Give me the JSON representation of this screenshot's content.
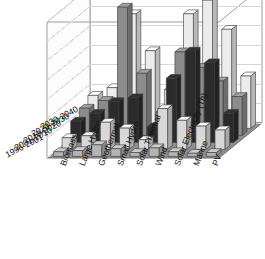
{
  "chart_data": {
    "type": "bar",
    "projection": "3d-bar",
    "title": "",
    "subtitle": "",
    "xlabel": "",
    "ylabel": "",
    "zlabel": "",
    "ylim": [
      0,
      0.35
    ],
    "grid": true,
    "legend_position": "none",
    "decimal_separator": ",",
    "categories": [
      "Biomass",
      "Large Hydro",
      "Geothermal",
      "Small Hydro",
      "Solar Thermal",
      "Wind",
      "Solar Electricity (Th)",
      "Marine",
      "PV"
    ],
    "ytick_labels": [
      "0",
      "0,05",
      "0,1",
      "0,15",
      "0,2",
      "0,25",
      "0,3",
      "0,35"
    ],
    "ytick_values": [
      0,
      0.05,
      0.1,
      0.15,
      0.2,
      0.25,
      0.3,
      0.35
    ],
    "series": [
      {
        "name": "1996-2001",
        "color": "#b4b4b4",
        "values": [
          0.012,
          0.015,
          0.03,
          0.02,
          0.01,
          0.022,
          0.012,
          0.008,
          0.01
        ]
      },
      {
        "name": "2001-2010",
        "color": "#d8d8d8",
        "values": [
          0.03,
          0.035,
          0.07,
          0.055,
          0.025,
          0.105,
          0.075,
          0.06,
          0.05
        ]
      },
      {
        "name": "2010-2020",
        "color": "#2b2b2b",
        "values": [
          0.055,
          0.075,
          0.105,
          0.115,
          0.04,
          0.165,
          0.235,
          0.205,
          0.075
        ]
      },
      {
        "name": "2020-2030",
        "color": "#8c8c8c",
        "values": [
          0.07,
          0.09,
          0.33,
          0.16,
          0.06,
          0.215,
          0.175,
          0.14,
          0.1
        ]
      },
      {
        "name": "2030-2040",
        "color": "#ececec",
        "values": [
          0.085,
          0.105,
          0.295,
          0.2,
          0.1,
          0.295,
          0.33,
          0.255,
          0.135
        ]
      }
    ]
  }
}
